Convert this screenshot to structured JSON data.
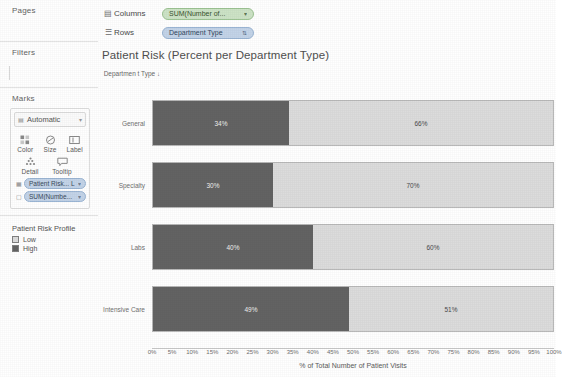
{
  "left_panel": {
    "pages": {
      "title": "Pages"
    },
    "filters": {
      "title": "Filters"
    },
    "marks": {
      "title": "Marks",
      "mark_type": "Automatic",
      "mark_type_icon": "marks-type-icon",
      "caret_icon": "chevron-down-icon",
      "buttons": [
        {
          "label": "Color",
          "icon": "color-icon"
        },
        {
          "label": "Size",
          "icon": "size-icon"
        },
        {
          "label": "Label",
          "icon": "label-icon"
        },
        {
          "label": "Detail",
          "icon": "detail-icon"
        },
        {
          "label": "Tooltip",
          "icon": "tooltip-icon"
        }
      ],
      "pills": [
        {
          "text": "Patient Risk... L",
          "icon": "color-icon"
        },
        {
          "text": "SUM(Numbe...",
          "icon": "label-icon"
        }
      ]
    },
    "legend": {
      "title": "Patient Risk Profile",
      "items": [
        {
          "label": "Low",
          "color": "#dcdcdc"
        },
        {
          "label": "High",
          "color": "#636363"
        }
      ]
    }
  },
  "shelves": [
    {
      "icon": "columns-icon",
      "name": "Columns",
      "pill": {
        "text": "SUM(Number of...",
        "type": "measure-green",
        "icon": ""
      }
    },
    {
      "icon": "rows-icon",
      "name": "Rows",
      "pill": {
        "text": "Department Type",
        "type": "dimension-blue",
        "icon": "sort-icon"
      }
    }
  ],
  "viz": {
    "title": "Patient Risk (Percent per Department Type)",
    "row_header_label": "Departmen t Type",
    "row_header_sort_icon": "sort-descending-icon"
  },
  "chart_data": {
    "type": "bar",
    "orientation": "horizontal",
    "stacked": true,
    "stack_mode": "percent",
    "title": "Patient Risk (Percent per Department Type)",
    "xlabel": "% of Total Number of Patient Visits",
    "ylabel": "Department Type",
    "xlim": [
      0,
      100
    ],
    "grid": false,
    "legend": {
      "title": "Patient Risk Profile",
      "position": "left-panel",
      "entries": [
        "Low",
        "High"
      ]
    },
    "categories": [
      "General",
      "Specialty",
      "Labs",
      "Intensive Care"
    ],
    "series": [
      {
        "name": "High",
        "color": "#636363",
        "values": [
          34,
          30,
          40,
          49
        ],
        "labels": [
          "34%",
          "30%",
          "40%",
          "49%"
        ]
      },
      {
        "name": "Low",
        "color": "#dcdcdc",
        "values": [
          66,
          70,
          60,
          51
        ],
        "labels": [
          "66%",
          "70%",
          "60%",
          "51%"
        ]
      }
    ],
    "xticks": [
      0,
      5,
      10,
      15,
      20,
      25,
      30,
      35,
      40,
      45,
      50,
      55,
      60,
      65,
      70,
      75,
      80,
      85,
      90,
      95,
      100
    ],
    "xticklabels": [
      "0%",
      "5%",
      "10%",
      "15%",
      "20%",
      "25%",
      "30%",
      "35%",
      "40%",
      "45%",
      "50%",
      "55%",
      "60%",
      "65%",
      "70%",
      "75%",
      "80%",
      "85%",
      "90%",
      "95%",
      "100%"
    ]
  }
}
